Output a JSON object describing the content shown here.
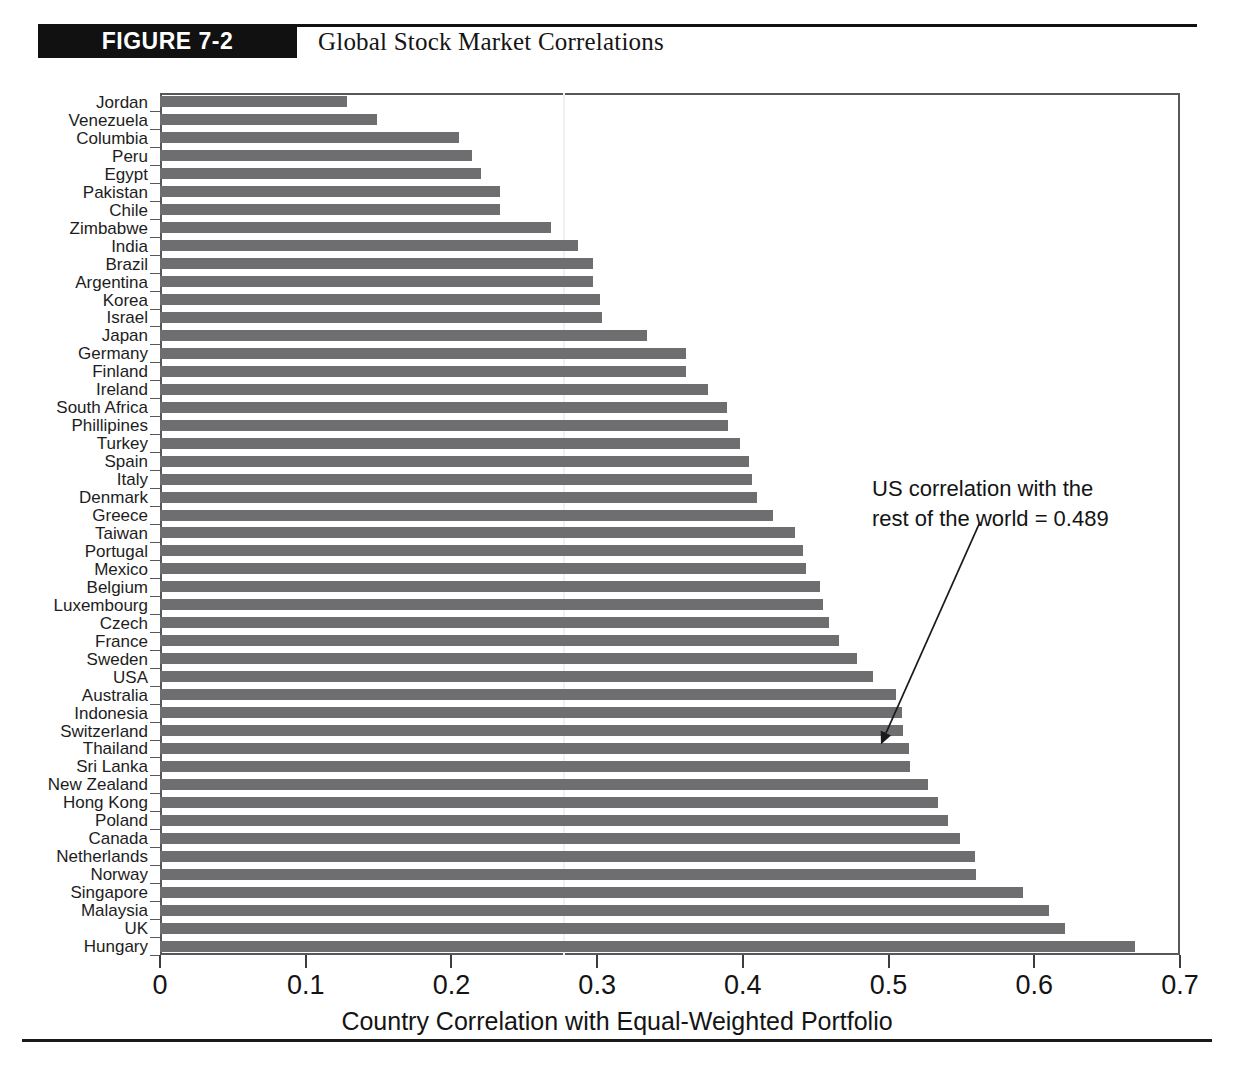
{
  "header": {
    "figure_badge": "FIGURE 7-2",
    "figure_title": "Global Stock Market Correlations"
  },
  "annotation": {
    "line1": "US correlation with the",
    "line2": "rest of the world = 0.489"
  },
  "chart_data": {
    "type": "bar",
    "orientation": "horizontal",
    "title": "Global Stock Market Correlations",
    "xlabel": "Country Correlation with Equal-Weighted Portfolio",
    "ylabel": "",
    "xlim": [
      0,
      0.7
    ],
    "xticks": [
      0,
      0.1,
      0.2,
      0.3,
      0.4,
      0.5,
      0.6,
      0.7
    ],
    "xtick_labels": [
      "0",
      "0.1",
      "0.2",
      "0.3",
      "0.4",
      "0.5",
      "0.6",
      "0.7"
    ],
    "grid": false,
    "legend": null,
    "bar_color": "#6e6e70",
    "categories": [
      "Jordan",
      "Venezuela",
      "Columbia",
      "Peru",
      "Egypt",
      "Pakistan",
      "Chile",
      "Zimbabwe",
      "India",
      "Brazil",
      "Argentina",
      "Korea",
      "Israel",
      "Japan",
      "Germany",
      "Finland",
      "Ireland",
      "South Africa",
      "Phillipines",
      "Turkey",
      "Spain",
      "Italy",
      "Denmark",
      "Greece",
      "Taiwan",
      "Portugal",
      "Mexico",
      "Belgium",
      "Luxembourg",
      "Czech",
      "France",
      "Sweden",
      "USA",
      "Australia",
      "Indonesia",
      "Switzerland",
      "Thailand",
      "Sri Lanka",
      "New Zealand",
      "Hong Kong",
      "Poland",
      "Canada",
      "Netherlands",
      "Norway",
      "Singapore",
      "Malaysia",
      "UK",
      "Hungary"
    ],
    "values": [
      0.128,
      0.149,
      0.205,
      0.214,
      0.22,
      0.233,
      0.233,
      0.268,
      0.287,
      0.297,
      0.297,
      0.302,
      0.303,
      0.334,
      0.361,
      0.361,
      0.376,
      0.389,
      0.39,
      0.398,
      0.404,
      0.406,
      0.41,
      0.421,
      0.436,
      0.441,
      0.443,
      0.453,
      0.455,
      0.459,
      0.466,
      0.478,
      0.489,
      0.505,
      0.509,
      0.51,
      0.514,
      0.515,
      0.527,
      0.534,
      0.541,
      0.549,
      0.559,
      0.56,
      0.592,
      0.61,
      0.621,
      0.669
    ],
    "annotations": [
      {
        "text": "US correlation with the rest of the world = 0.489",
        "points_to_category": "USA",
        "points_to_value": 0.489
      }
    ]
  }
}
